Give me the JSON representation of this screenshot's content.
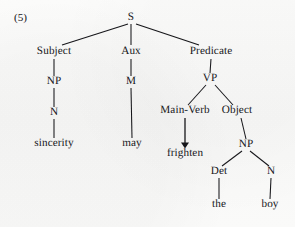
{
  "figure": {
    "example_number": "(5)",
    "type": "phrase-structure-tree",
    "ink_color": "#16161a",
    "background_color": "#fbfbfa",
    "width": 295,
    "height": 227
  },
  "tree": {
    "nodes": [
      {
        "id": "s",
        "label": "S",
        "kind": "category",
        "x": 131,
        "y": 18
      },
      {
        "id": "subject",
        "label": "Subject",
        "kind": "function",
        "x": 54,
        "y": 52
      },
      {
        "id": "aux",
        "label": "Aux",
        "kind": "function",
        "x": 131,
        "y": 52
      },
      {
        "id": "predicate",
        "label": "Predicate",
        "kind": "function",
        "x": 211,
        "y": 52
      },
      {
        "id": "np1",
        "label": "NP",
        "kind": "category",
        "x": 54,
        "y": 82
      },
      {
        "id": "m",
        "label": "M",
        "kind": "category",
        "x": 131,
        "y": 82
      },
      {
        "id": "vp",
        "label": "VP",
        "kind": "category",
        "x": 210,
        "y": 79
      },
      {
        "id": "n1",
        "label": "N",
        "kind": "category",
        "x": 54,
        "y": 113
      },
      {
        "id": "main-verb",
        "label": "Main-Verb",
        "kind": "function",
        "x": 185,
        "y": 111
      },
      {
        "id": "object",
        "label": "Object",
        "kind": "function",
        "x": 237,
        "y": 111
      },
      {
        "id": "np2",
        "label": "NP",
        "kind": "category",
        "x": 246,
        "y": 145
      },
      {
        "id": "det",
        "label": "Det",
        "kind": "category",
        "x": 219,
        "y": 172
      },
      {
        "id": "n2",
        "label": "N",
        "kind": "category",
        "x": 271,
        "y": 172
      },
      {
        "id": "sincerity",
        "label": "sincerity",
        "kind": "word",
        "x": 54,
        "y": 144
      },
      {
        "id": "may",
        "label": "may",
        "kind": "word",
        "x": 132,
        "y": 144
      },
      {
        "id": "frighten",
        "label": "frighten",
        "kind": "word",
        "x": 185,
        "y": 154
      },
      {
        "id": "the",
        "label": "the",
        "kind": "word",
        "x": 219,
        "y": 205
      },
      {
        "id": "boy",
        "label": "boy",
        "kind": "word",
        "x": 270,
        "y": 205
      }
    ],
    "edges": [
      {
        "from": "s",
        "to": "subject",
        "x1": 128,
        "y1": 24,
        "x2": 62,
        "y2": 45,
        "style": "line"
      },
      {
        "from": "s",
        "to": "aux",
        "x1": 131,
        "y1": 24,
        "x2": 131,
        "y2": 45,
        "style": "line"
      },
      {
        "from": "s",
        "to": "predicate",
        "x1": 136,
        "y1": 24,
        "x2": 199,
        "y2": 45,
        "style": "line"
      },
      {
        "from": "subject",
        "to": "np1",
        "x1": 54,
        "y1": 59,
        "x2": 54,
        "y2": 76,
        "style": "line"
      },
      {
        "from": "aux",
        "to": "m",
        "x1": 131,
        "y1": 59,
        "x2": 131,
        "y2": 76,
        "style": "line"
      },
      {
        "from": "predicate",
        "to": "vp",
        "x1": 211,
        "y1": 59,
        "x2": 210,
        "y2": 73,
        "style": "line"
      },
      {
        "from": "np1",
        "to": "n1",
        "x1": 54,
        "y1": 88,
        "x2": 54,
        "y2": 107,
        "style": "line"
      },
      {
        "from": "m",
        "to": "may",
        "x1": 131,
        "y1": 88,
        "x2": 132,
        "y2": 138,
        "style": "line"
      },
      {
        "from": "vp",
        "to": "main-verb",
        "x1": 206,
        "y1": 85,
        "x2": 188,
        "y2": 105,
        "style": "line"
      },
      {
        "from": "vp",
        "to": "object",
        "x1": 215,
        "y1": 85,
        "x2": 233,
        "y2": 105,
        "style": "line"
      },
      {
        "from": "n1",
        "to": "sincerity",
        "x1": 54,
        "y1": 119,
        "x2": 54,
        "y2": 138,
        "style": "line"
      },
      {
        "from": "main-verb",
        "to": "frighten",
        "x1": 185,
        "y1": 118,
        "x2": 185,
        "y2": 144,
        "style": "arrow"
      },
      {
        "from": "object",
        "to": "np2",
        "x1": 241,
        "y1": 118,
        "x2": 246,
        "y2": 139,
        "style": "line"
      },
      {
        "from": "np2",
        "to": "det",
        "x1": 242,
        "y1": 151,
        "x2": 222,
        "y2": 166,
        "style": "line"
      },
      {
        "from": "np2",
        "to": "n2",
        "x1": 250,
        "y1": 151,
        "x2": 269,
        "y2": 166,
        "style": "line"
      },
      {
        "from": "det",
        "to": "the",
        "x1": 219,
        "y1": 178,
        "x2": 219,
        "y2": 199,
        "style": "line"
      },
      {
        "from": "n2",
        "to": "boy",
        "x1": 271,
        "y1": 178,
        "x2": 270,
        "y2": 199,
        "style": "line"
      }
    ],
    "sentence": "sincerity may frighten the boy"
  }
}
